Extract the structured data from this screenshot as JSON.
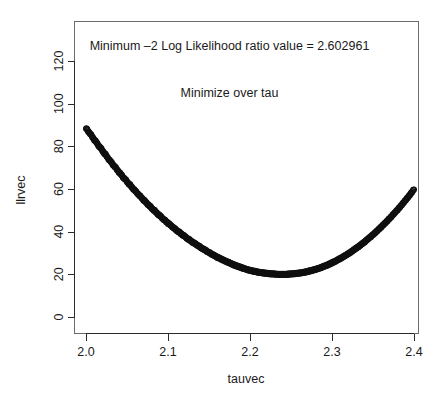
{
  "chart_data": {
    "type": "scatter",
    "title": "",
    "xlabel": "tauvec",
    "ylabel": "llrvec",
    "xlim": [
      1.99,
      2.41
    ],
    "ylim": [
      -3,
      136
    ],
    "grid": false,
    "legend": null,
    "marker": "open-circle",
    "annotations": [
      {
        "text": "Minimum –2 Log Likelihood ratio value = 2.602961",
        "x": 2.175,
        "y": 125
      },
      {
        "text": "Minimize over tau",
        "x": 2.175,
        "y": 103
      }
    ],
    "xticks": [
      2.0,
      2.1,
      2.2,
      2.3,
      2.4
    ],
    "xtick_labels": [
      "2.0",
      "2.1",
      "2.2",
      "2.3",
      "2.4"
    ],
    "yticks": [
      0,
      20,
      40,
      60,
      80,
      100,
      120
    ],
    "ytick_labels": [
      "0",
      "20",
      "40",
      "60",
      "80",
      "100",
      "120"
    ],
    "minimum": {
      "tau": 2.15,
      "value": 2.602961
    },
    "x": [
      2.0,
      2.002,
      2.004,
      2.006,
      2.008,
      2.01,
      2.012,
      2.014,
      2.016,
      2.018,
      2.02,
      2.022,
      2.024,
      2.026,
      2.028,
      2.03,
      2.032,
      2.034,
      2.036,
      2.038,
      2.04,
      2.042,
      2.044,
      2.046,
      2.048,
      2.05,
      2.052,
      2.054,
      2.056,
      2.058,
      2.06,
      2.062,
      2.064,
      2.066,
      2.068,
      2.07,
      2.072,
      2.074,
      2.076,
      2.078,
      2.08,
      2.082,
      2.084,
      2.086,
      2.088,
      2.09,
      2.092,
      2.094,
      2.096,
      2.098,
      2.1,
      2.102,
      2.104,
      2.106,
      2.108,
      2.11,
      2.112,
      2.114,
      2.116,
      2.118,
      2.12,
      2.122,
      2.124,
      2.126,
      2.128,
      2.13,
      2.132,
      2.134,
      2.136,
      2.138,
      2.14,
      2.142,
      2.144,
      2.146,
      2.148,
      2.15,
      2.152,
      2.154,
      2.156,
      2.158,
      2.16,
      2.162,
      2.164,
      2.166,
      2.168,
      2.17,
      2.172,
      2.174,
      2.176,
      2.178,
      2.18,
      2.182,
      2.184,
      2.186,
      2.188,
      2.19,
      2.192,
      2.194,
      2.196,
      2.198,
      2.2,
      2.202,
      2.204,
      2.206,
      2.208,
      2.21,
      2.212,
      2.214,
      2.216,
      2.218,
      2.22,
      2.222,
      2.224,
      2.226,
      2.228,
      2.23,
      2.232,
      2.234,
      2.236,
      2.238,
      2.24,
      2.242,
      2.244,
      2.246,
      2.248,
      2.25,
      2.252,
      2.254,
      2.256,
      2.258,
      2.26,
      2.262,
      2.264,
      2.266,
      2.268,
      2.27,
      2.272,
      2.274,
      2.276,
      2.278,
      2.28,
      2.282,
      2.284,
      2.286,
      2.288,
      2.29,
      2.292,
      2.294,
      2.296,
      2.298,
      2.3,
      2.302,
      2.304,
      2.306,
      2.308,
      2.31,
      2.312,
      2.314,
      2.316,
      2.318,
      2.32,
      2.322,
      2.324,
      2.326,
      2.328,
      2.33,
      2.332,
      2.334,
      2.336,
      2.338,
      2.34,
      2.342,
      2.344,
      2.346,
      2.348,
      2.35,
      2.352,
      2.354,
      2.356,
      2.358,
      2.36,
      2.362,
      2.364,
      2.366,
      2.368,
      2.37,
      2.372,
      2.374,
      2.376,
      2.378,
      2.38,
      2.382,
      2.384,
      2.386,
      2.388,
      2.39,
      2.392,
      2.394,
      2.396,
      2.398,
      2.4
    ],
    "y": [
      88.6,
      87.5,
      86.3,
      85.6,
      84.3,
      83.0,
      82.4,
      81.1,
      79.9,
      79.3,
      78.0,
      76.8,
      76.2,
      74.9,
      73.7,
      73.1,
      71.9,
      70.8,
      70.2,
      69.0,
      67.9,
      67.3,
      66.2,
      65.1,
      64.6,
      63.5,
      62.4,
      61.9,
      60.8,
      59.8,
      59.3,
      58.3,
      57.3,
      56.8,
      55.8,
      54.8,
      54.4,
      53.4,
      52.5,
      52.0,
      51.1,
      50.2,
      49.8,
      48.9,
      48.0,
      47.6,
      46.8,
      45.9,
      45.5,
      44.7,
      43.9,
      43.5,
      42.7,
      42.0,
      41.6,
      40.8,
      40.1,
      39.8,
      39.0,
      38.4,
      38.0,
      37.3,
      36.6,
      36.3,
      35.6,
      35.0,
      34.7,
      34.1,
      33.5,
      33.2,
      32.6,
      32.0,
      31.7,
      31.2,
      30.6,
      30.3,
      29.8,
      29.3,
      29.0,
      28.5,
      28.0,
      27.8,
      27.3,
      26.9,
      26.6,
      26.2,
      25.8,
      25.6,
      25.2,
      24.8,
      24.5,
      24.2,
      23.9,
      23.6,
      23.4,
      23.1,
      22.8,
      22.6,
      22.3,
      22.1,
      21.9,
      21.7,
      21.5,
      21.4,
      21.2,
      21.0,
      20.9,
      20.8,
      20.7,
      20.6,
      20.5,
      20.4,
      20.3,
      20.2,
      20.2,
      20.1,
      20.1,
      20.0,
      20.0,
      20.0,
      20.0,
      20.0,
      20.0,
      20.1,
      20.1,
      20.2,
      20.2,
      20.3,
      20.4,
      20.5,
      20.6,
      20.7,
      20.8,
      21.0,
      21.1,
      21.3,
      21.5,
      21.7,
      21.9,
      22.1,
      22.3,
      22.6,
      22.8,
      23.1,
      23.4,
      23.7,
      24.0,
      24.3,
      24.7,
      25.0,
      25.4,
      25.8,
      26.1,
      26.6,
      27.0,
      27.4,
      27.8,
      28.3,
      28.8,
      29.2,
      29.7,
      30.2,
      30.7,
      31.3,
      31.8,
      32.4,
      32.9,
      33.5,
      34.1,
      34.7,
      35.3,
      36.0,
      36.6,
      37.3,
      37.9,
      38.6,
      39.3,
      40.0,
      40.7,
      41.5,
      42.2,
      43.0,
      43.7,
      44.5,
      45.3,
      46.1,
      46.9,
      47.8,
      48.6,
      49.5,
      50.3,
      51.2,
      52.1,
      53.0,
      54.0,
      54.9,
      55.8,
      56.8,
      57.8,
      58.8,
      59.8
    ]
  }
}
